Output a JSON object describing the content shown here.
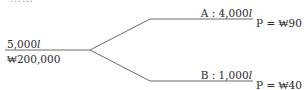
{
  "top_text_clipped": "……",
  "source": {
    "quantity": "5,000",
    "quantity_unit": "l",
    "cost": "₩200,000"
  },
  "branches": [
    {
      "name": "A",
      "label_prefix": "A : 4,000",
      "unit": "l",
      "price": "P = ₩90"
    },
    {
      "name": "B",
      "label_prefix": "B : 1,000",
      "unit": "l",
      "price": "P = ₩40"
    }
  ],
  "colors": {
    "line": "#6b6b6b",
    "text": "#2a2a2a"
  }
}
